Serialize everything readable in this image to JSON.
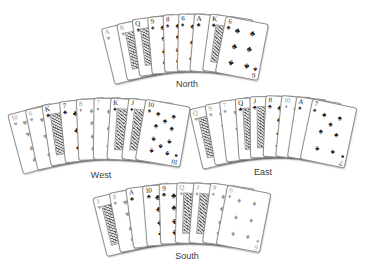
{
  "figure": {
    "background": "#ffffff",
    "description_labels": [
      "North",
      "West",
      "East",
      "South"
    ]
  },
  "colors": {
    "black_suit": "#1b1b1b",
    "red_suit": "#9a9a9a",
    "card_face": "#ffffff",
    "card_border": "#8f8f8f",
    "label_text": "#3a3a3a"
  },
  "suit_glyphs": {
    "S": "♠",
    "H": "♥",
    "D": "♦",
    "C": "♣"
  },
  "hands": [
    {
      "id": "north",
      "label": "North",
      "cards": [
        {
          "rank": "A",
          "suit": "H"
        },
        {
          "rank": "K",
          "suit": "H"
        },
        {
          "rank": "Q",
          "suit": "S"
        },
        {
          "rank": "9",
          "suit": "S"
        },
        {
          "rank": "8",
          "suit": "S"
        },
        {
          "rank": "6",
          "suit": "S"
        },
        {
          "rank": "A",
          "suit": "C"
        },
        {
          "rank": "K",
          "suit": "C"
        },
        {
          "rank": "6",
          "suit": "C"
        }
      ]
    },
    {
      "id": "west",
      "label": "West",
      "cards": [
        {
          "rank": "10",
          "suit": "H"
        },
        {
          "rank": "6",
          "suit": "H"
        },
        {
          "rank": "K",
          "suit": "C"
        },
        {
          "rank": "7",
          "suit": "C"
        },
        {
          "rank": "8",
          "suit": "D"
        },
        {
          "rank": "7",
          "suit": "D"
        },
        {
          "rank": "K",
          "suit": "S"
        },
        {
          "rank": "J",
          "suit": "S"
        },
        {
          "rank": "10",
          "suit": "S"
        }
      ]
    },
    {
      "id": "east",
      "label": "East",
      "cards": [
        {
          "rank": "Q",
          "suit": "H"
        },
        {
          "rank": "9",
          "suit": "H"
        },
        {
          "rank": "7",
          "suit": "H"
        },
        {
          "rank": "Q",
          "suit": "C"
        },
        {
          "rank": "J",
          "suit": "C"
        },
        {
          "rank": "8",
          "suit": "C"
        },
        {
          "rank": "10",
          "suit": "D"
        },
        {
          "rank": "A",
          "suit": "S"
        },
        {
          "rank": "7",
          "suit": "S"
        }
      ]
    },
    {
      "id": "south",
      "label": "South",
      "cards": [
        {
          "rank": "J",
          "suit": "H"
        },
        {
          "rank": "8",
          "suit": "H"
        },
        {
          "rank": "A",
          "suit": "C"
        },
        {
          "rank": "10",
          "suit": "C"
        },
        {
          "rank": "9",
          "suit": "C"
        },
        {
          "rank": "Q",
          "suit": "D"
        },
        {
          "rank": "J",
          "suit": "D"
        },
        {
          "rank": "9",
          "suit": "D"
        },
        {
          "rank": "6",
          "suit": "D"
        }
      ]
    }
  ]
}
